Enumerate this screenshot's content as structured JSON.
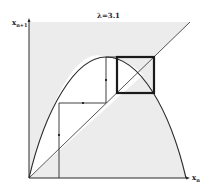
{
  "title": "λ=3.1",
  "axes": {
    "y_label": "x",
    "y_label_sub": "n+1",
    "x_label": "x",
    "x_label_sub": "n"
  },
  "colors": {
    "background": "#ffffff",
    "shade": "#ececec",
    "ink": "#2a2a2a"
  },
  "diagram": {
    "type": "cobweb",
    "map": "logistic",
    "lambda": 3.1,
    "origin_px": [
      29,
      178
    ],
    "x_axis_end_px": [
      189,
      178
    ],
    "y_axis_end_px": [
      29,
      19
    ],
    "shade_top_px": 22,
    "diagonal_end_px": [
      190,
      22
    ],
    "parabola": {
      "start_px": [
        29,
        178
      ],
      "peak_px": [
        106,
        57
      ],
      "end_px": [
        186,
        178
      ]
    },
    "cobweb_path_px": [
      [
        59,
        178
      ],
      [
        59,
        103
      ],
      [
        106,
        103
      ],
      [
        106,
        57
      ],
      [
        117,
        57
      ]
    ],
    "cycle_box_px": {
      "x1": 117,
      "y1": 57,
      "x2": 154,
      "y2": 93
    }
  }
}
